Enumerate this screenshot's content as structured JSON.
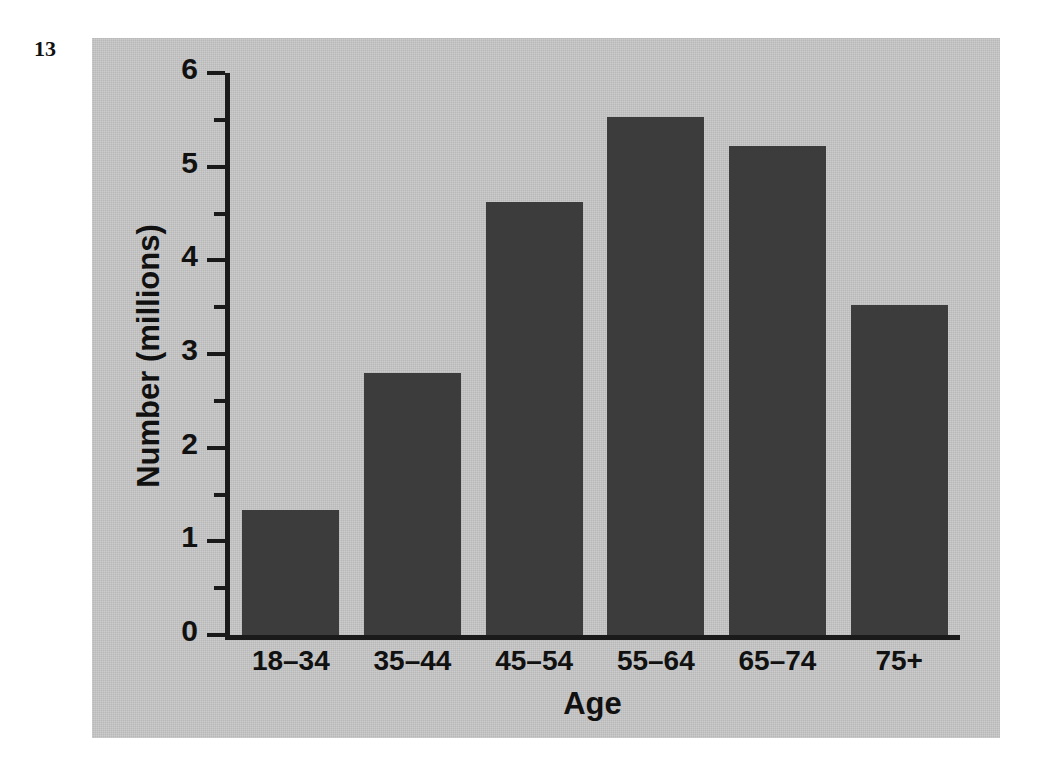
{
  "page_number": "13",
  "colors": {
    "panel_background": "#c6c6c6",
    "bar_fill": "#3c3c3c",
    "axis": "#1a1a1a",
    "text": "#111111",
    "page_background": "#ffffff"
  },
  "chart_data": {
    "type": "bar",
    "title": "",
    "xlabel": "Age",
    "ylabel": "Number (millions)",
    "categories": [
      "18–34",
      "35–44",
      "45–54",
      "55–64",
      "65–74",
      "75+"
    ],
    "values": [
      1.33,
      2.8,
      4.62,
      5.53,
      5.22,
      3.52
    ],
    "ylim": [
      0,
      6
    ],
    "y_ticks": [
      0,
      1,
      2,
      3,
      4,
      5,
      6
    ],
    "y_tick_labels": [
      "0",
      "1",
      "2",
      "3",
      "4",
      "5",
      "6"
    ],
    "y_minor_ticks": [
      0.5,
      1.5,
      2.5,
      3.5,
      4.5,
      5.5
    ],
    "grid": false,
    "legend": false,
    "legend_position": "none"
  }
}
